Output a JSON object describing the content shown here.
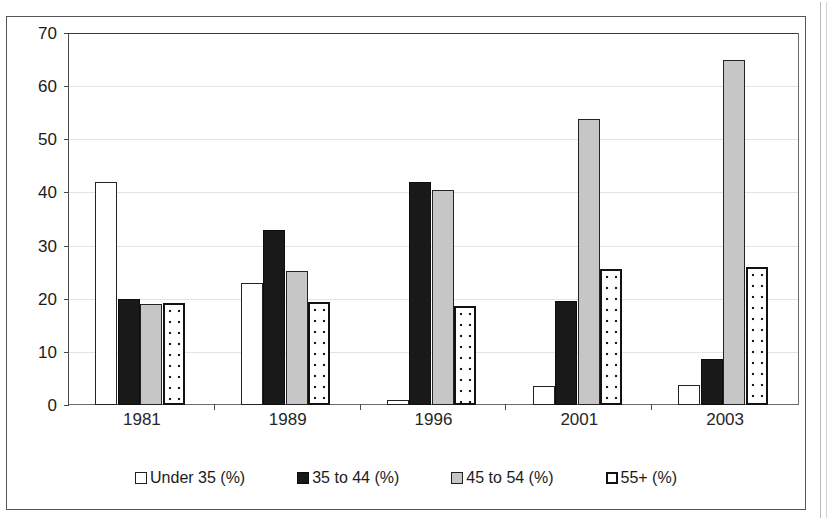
{
  "scan": {
    "top_fragment": "",
    "page_rule_color": "#b9b9bd"
  },
  "chart_data": {
    "type": "bar",
    "title": "",
    "subtitle": "",
    "xlabel": "",
    "ylabel": "",
    "categories": [
      "1981",
      "1989",
      "1996",
      "2001",
      "2003"
    ],
    "series": [
      {
        "name": "Under 35 (%)",
        "values": [
          42,
          23,
          1,
          3.5,
          3.7
        ],
        "fill": "white-outline",
        "color": "#ffffff"
      },
      {
        "name": "35 to 44 (%)",
        "values": [
          20,
          33,
          42,
          19.5,
          8.7
        ],
        "fill": "solid-black",
        "color": "#191919"
      },
      {
        "name": "45 to 54 (%)",
        "values": [
          19,
          25.3,
          40.5,
          53.8,
          64.9
        ],
        "fill": "light-grey",
        "color": "#c6c6c6"
      },
      {
        "name": "55+ (%)",
        "values": [
          19.2,
          19.4,
          18.6,
          25.6,
          25.9
        ],
        "fill": "dotted-pattern",
        "color": "#ffffff"
      }
    ],
    "ylim": [
      0,
      70
    ],
    "yticks": [
      0,
      10,
      20,
      30,
      40,
      50,
      60,
      70
    ],
    "ytick_labels": [
      "0",
      "10",
      "20",
      "30",
      "40",
      "50",
      "60",
      "70"
    ],
    "grid": true,
    "grid_axis": "y",
    "legend_position": "bottom",
    "legend_entries": [
      "Under 35 (%)",
      "35 to 44 (%)",
      "45 to 54 (%)",
      "55+ (%)"
    ]
  }
}
